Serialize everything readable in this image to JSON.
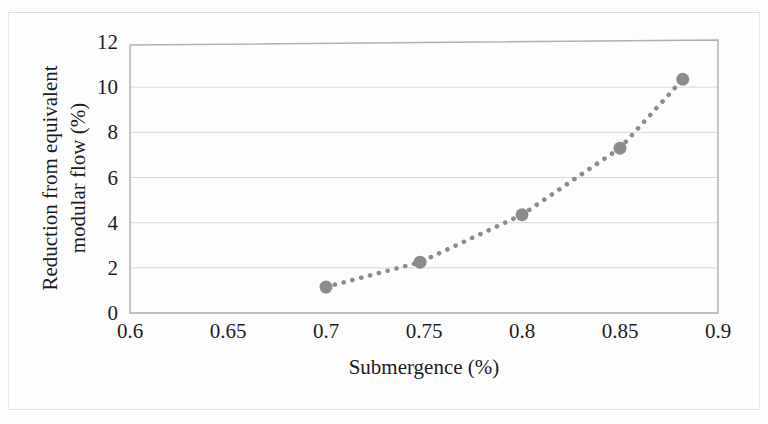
{
  "figure": {
    "background_color": "#fdfdfd",
    "border_color": "#e6e6e6"
  },
  "chart_data": {
    "type": "scatter",
    "title": "",
    "subtitle": "",
    "xlabel": "Submergence (%)",
    "ylabel": "Reduction from equivalent modular flow (%)",
    "ylabel_line1": "Reduction from equivalent",
    "ylabel_line2": "modular flow (%)",
    "xlim": [
      0.6,
      0.9
    ],
    "ylim": [
      0,
      12
    ],
    "xticks": [
      0.6,
      0.65,
      0.7,
      0.75,
      0.8,
      0.85,
      0.9
    ],
    "xtick_labels": [
      "0.6",
      "0.65",
      "0.7",
      "0.75",
      "0.8",
      "0.85",
      "0.9"
    ],
    "yticks": [
      0,
      2,
      4,
      6,
      8,
      10,
      12
    ],
    "ytick_labels": [
      "0",
      "2",
      "4",
      "6",
      "8",
      "10",
      "12"
    ],
    "grid": "horizontal",
    "grid_color": "#d9d9d9",
    "legend": "none",
    "series": [
      {
        "name": "Reduction from equivalent modular flow",
        "marker": "circle",
        "marker_color": "#8c8c8c",
        "marker_size": 13,
        "line_style": "dotted",
        "line_color": "#8c8c8c",
        "x": [
          0.7,
          0.748,
          0.8,
          0.85,
          0.882
        ],
        "values": [
          1.15,
          2.25,
          4.35,
          7.3,
          10.35
        ]
      }
    ]
  }
}
